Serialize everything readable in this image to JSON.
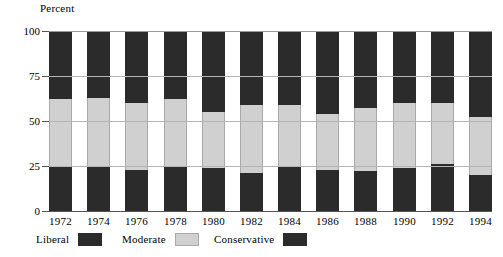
{
  "axis": {
    "y_title": "Percent",
    "y_ticks": [
      "100",
      "75",
      "50",
      "25",
      "0"
    ]
  },
  "legend": {
    "items": [
      {
        "label": "Liberal",
        "swatch": "dark-swatch-icon",
        "color": "#2b2b2b"
      },
      {
        "label": "Moderate",
        "swatch": "light-swatch-icon",
        "color": "#d0d0d0"
      },
      {
        "label": "Conservative",
        "swatch": "dark-swatch-icon",
        "color": "#2b2b2b"
      }
    ]
  },
  "chart_data": {
    "type": "bar",
    "title": "",
    "subtitle": "",
    "xlabel": "",
    "ylabel": "Percent",
    "ylim": [
      0,
      100
    ],
    "yticks": [
      0,
      25,
      50,
      75,
      100
    ],
    "grid": true,
    "stacked": true,
    "legend_position": "bottom",
    "categories": [
      "1972",
      "1974",
      "1976",
      "1978",
      "1980",
      "1982",
      "1984",
      "1986",
      "1988",
      "1990",
      "1992",
      "1994"
    ],
    "series": [
      {
        "name": "Liberal",
        "color": "#2b2b2b",
        "values": [
          25,
          25,
          23,
          25,
          24,
          21,
          25,
          23,
          22,
          24,
          26,
          20
        ]
      },
      {
        "name": "Moderate",
        "color": "#d0d0d0",
        "values": [
          37,
          38,
          37,
          37,
          31,
          38,
          34,
          31,
          35,
          36,
          34,
          32
        ]
      },
      {
        "name": "Conservative",
        "color": "#2b2b2b",
        "values": [
          38,
          37,
          40,
          38,
          45,
          41,
          41,
          46,
          43,
          40,
          40,
          48
        ]
      }
    ]
  }
}
